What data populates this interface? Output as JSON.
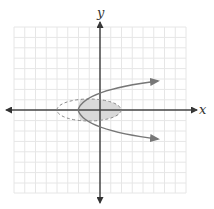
{
  "diagram": {
    "type": "coordinate-plane",
    "axes": {
      "x_label": "x",
      "y_label": "y",
      "axis_color": "#555555"
    },
    "grid": {
      "cells": 16,
      "line_color": "#e3e3e3",
      "bounds": {
        "left": 14,
        "top": 27,
        "right": 186,
        "bottom": 193
      }
    },
    "curves": [
      {
        "name": "parabola",
        "description": "sideways parabola opening right, solid, with arrows",
        "color": "#777777",
        "vertex": [
          78,
          110
        ],
        "arrow_ends": [
          [
            158,
            81
          ],
          [
            158,
            139
          ]
        ]
      },
      {
        "name": "ellipse",
        "description": "dashed ellipse centered on x-axis",
        "color": "#888888",
        "style": "dashed",
        "center": [
          89,
          110
        ],
        "rx": 32,
        "ry": 11
      }
    ],
    "shaded_region": {
      "description": "intersection of ellipse interior and region right of the parabola",
      "fill": "#d9d9d9"
    }
  }
}
